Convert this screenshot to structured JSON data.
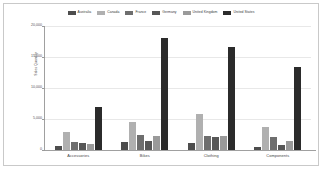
{
  "chart_data": {
    "type": "bar",
    "title": "",
    "xlabel": "",
    "ylabel": "Sales Quantity",
    "ylim": [
      0,
      20000
    ],
    "ytick_labels": [
      "20,000",
      "15,000",
      "10,000",
      "5,000",
      "0"
    ],
    "ytick_values": [
      20000,
      15000,
      10000,
      5000,
      0
    ],
    "grid": true,
    "legend_position": "top",
    "categories": [
      "Accessories",
      "Bikes",
      "Clothing",
      "Components"
    ],
    "series": [
      {
        "name": "Australia",
        "color": "#4d4d4d",
        "values": [
          700,
          1250,
          1150,
          550
        ]
      },
      {
        "name": "Canada",
        "color": "#b0b0b0",
        "values": [
          2850,
          4500,
          5850,
          3700
        ]
      },
      {
        "name": "France",
        "color": "#6e6e6e",
        "values": [
          1300,
          2500,
          2250,
          2100
        ]
      },
      {
        "name": "Germany",
        "color": "#575757",
        "values": [
          1200,
          1400,
          2050,
          750
        ]
      },
      {
        "name": "United Kingdom",
        "color": "#9a9a9a",
        "values": [
          1000,
          2300,
          2200,
          1450
        ]
      },
      {
        "name": "United States",
        "color": "#2b2b2b",
        "values": [
          6950,
          18050,
          16550,
          13400
        ]
      }
    ]
  }
}
